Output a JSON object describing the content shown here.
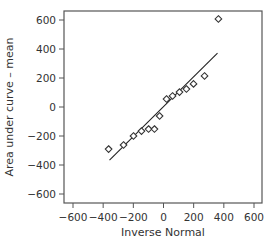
{
  "chart_data": {
    "type": "scatter",
    "title": "",
    "xlabel": "Inverse Normal",
    "ylabel": "Area under curve – mean",
    "xlim": [
      -650,
      650
    ],
    "ylim": [
      -650,
      650
    ],
    "xticks": [
      -600,
      -400,
      -200,
      0,
      200,
      400,
      600
    ],
    "yticks": [
      -600,
      -400,
      -200,
      0,
      200,
      400,
      600
    ],
    "xtick_labels": [
      "−600",
      "−400",
      "−200",
      "0",
      "200",
      "400",
      "600"
    ],
    "ytick_labels": [
      "−600",
      "−400",
      "−200",
      "0",
      "200",
      "400",
      "600"
    ],
    "grid": false,
    "legend": null,
    "marker": "diamond-open",
    "series": [
      {
        "name": "observations",
        "kind": "scatter",
        "x": [
          -364,
          -265,
          -199,
          -146,
          -99,
          -60,
          -26,
          20,
          60,
          106,
          152,
          199,
          272,
          364
        ],
        "y": [
          -290,
          -262,
          -200,
          -166,
          -152,
          -152,
          -62,
          55,
          76,
          103,
          124,
          159,
          214,
          607
        ]
      },
      {
        "name": "reference line",
        "kind": "line",
        "x": [
          -358,
          358
        ],
        "y": [
          -366,
          372
        ]
      }
    ],
    "colors": {
      "axis": "#555555",
      "marker": "#333333",
      "line": "#222222"
    }
  }
}
